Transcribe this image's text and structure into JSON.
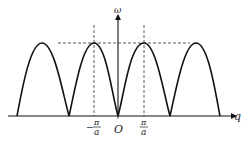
{
  "diagram": {
    "axes": {
      "y_label": "ω",
      "x_label": "q",
      "origin_label": "O"
    },
    "ticks": [
      {
        "id": "neg_pi_a",
        "numerator": "π",
        "denominator": "a",
        "sign": "−"
      },
      {
        "id": "pos_pi_a",
        "numerator": "π",
        "denominator": "a",
        "sign": ""
      }
    ],
    "colors": {
      "curve": "#111111",
      "axis": "#111111",
      "dashed": "#333333"
    }
  }
}
